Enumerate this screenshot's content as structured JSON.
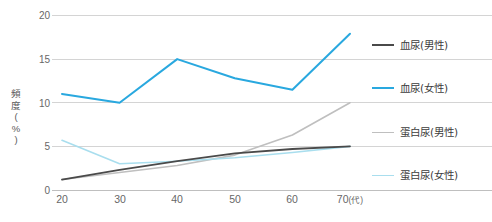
{
  "chart_data": {
    "type": "line",
    "title": "",
    "xlabel": "",
    "ylabel": "頻度(%)",
    "ylabel_chars": [
      "頻",
      "度",
      "(",
      "%",
      ")"
    ],
    "x": [
      20,
      30,
      40,
      50,
      60,
      70
    ],
    "categories": [
      "20",
      "30",
      "40",
      "50",
      "60",
      "70"
    ],
    "x_tick_labels": [
      "20",
      "30",
      "40",
      "50",
      "60",
      "70"
    ],
    "x_last_unit": "(代)",
    "y_tick_labels": [
      "0",
      "5",
      "10",
      "15",
      "20"
    ],
    "y_ticks": [
      0,
      5,
      10,
      15,
      20
    ],
    "ylim": [
      0,
      20
    ],
    "xlim": [
      20,
      70
    ],
    "grid": "horizontal",
    "legend_position": "right",
    "series": [
      {
        "name": "血尿(男性)",
        "color": "#4a4a4a",
        "width": 1.8,
        "values": [
          1.2,
          2.3,
          3.3,
          4.2,
          4.7,
          5.0
        ]
      },
      {
        "name": "血尿(女性)",
        "color": "#29A8DF",
        "width": 2.0,
        "values": [
          11.0,
          10.0,
          15.0,
          12.8,
          11.5,
          17.9
        ]
      },
      {
        "name": "蛋白尿(男性)",
        "color": "#BFBFBF",
        "width": 1.6,
        "values": [
          1.2,
          2.0,
          2.8,
          4.0,
          6.3,
          10.0
        ]
      },
      {
        "name": "蛋白尿(女性)",
        "color": "#A9DEEE",
        "width": 1.6,
        "values": [
          5.7,
          3.0,
          3.3,
          3.7,
          4.3,
          5.0
        ]
      }
    ]
  },
  "legend": {
    "items": [
      {
        "label": "血尿(男性)",
        "color": "#4a4a4a",
        "thickness": "2.2px"
      },
      {
        "label": "血尿(女性)",
        "color": "#29A8DF",
        "thickness": "2.2px"
      },
      {
        "label": "蛋白尿(男性)",
        "color": "#BFBFBF",
        "thickness": "1.6px"
      },
      {
        "label": "蛋白尿(女性)",
        "color": "#A9DEEE",
        "thickness": "1.6px"
      }
    ]
  },
  "axis": {
    "grid_color": "#D4D4D4",
    "baseline_color": "#BFBFBF",
    "tick_text_color": "#676767"
  },
  "caption": {
    "text": ""
  }
}
